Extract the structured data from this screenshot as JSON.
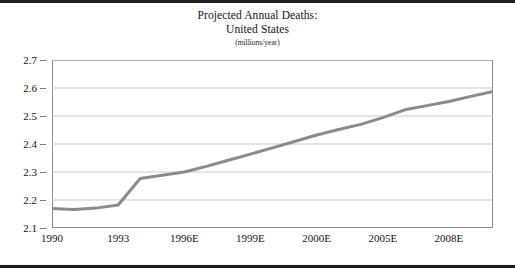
{
  "figure": {
    "title_line1": "Projected Annual Deaths:",
    "title_line2": "United States",
    "subtitle": "(millions/year)"
  },
  "chart_data": {
    "type": "line",
    "title": "Projected Annual Deaths: United States",
    "subtitle": "(millions/year)",
    "xlabel": "",
    "ylabel": "",
    "ylim": [
      2.1,
      2.7
    ],
    "yticks": [
      2.1,
      2.2,
      2.3,
      2.4,
      2.5,
      2.6,
      2.7
    ],
    "ytick_labels": [
      "2.1",
      "2.2",
      "2.3",
      "2.4",
      "2.5",
      "2.6",
      "2.7"
    ],
    "xtick_labels": [
      "1990",
      "1993",
      "1996E",
      "1999E",
      "2000E",
      "2005E",
      "2008E"
    ],
    "xtick_positions": [
      0,
      3,
      6,
      9,
      12,
      15,
      18
    ],
    "xlim": [
      0,
      20
    ],
    "grid": "horizontal",
    "legend": "none",
    "line_color": "#8a8a8a",
    "line_width": 3,
    "series": [
      {
        "name": "Projected annual deaths",
        "x": [
          0,
          1,
          2,
          3,
          4,
          5,
          6,
          7,
          8,
          9,
          10,
          11,
          12,
          13,
          14,
          15,
          16,
          17,
          18,
          19,
          20
        ],
        "values": [
          2.17,
          2.166,
          2.171,
          2.182,
          2.277,
          2.288,
          2.3,
          2.32,
          2.342,
          2.364,
          2.386,
          2.409,
          2.432,
          2.452,
          2.47,
          2.494,
          2.522,
          2.537,
          2.552,
          2.57,
          2.588
        ]
      }
    ],
    "series_extension": {
      "x": [
        20,
        21,
        22,
        23,
        24
      ],
      "values": [
        2.588,
        2.6,
        2.612,
        2.622,
        2.63
      ]
    }
  }
}
